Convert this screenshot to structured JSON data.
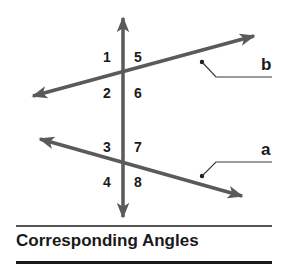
{
  "diagram": {
    "title": "Corresponding Angles",
    "colors": {
      "line": "#5a5a5a",
      "text": "#1a1a1a",
      "leader": "#3a3a3a"
    },
    "transversal": {
      "label": "",
      "x": 123,
      "y_top": 15,
      "y_bottom": 220
    },
    "lines": [
      {
        "id": "b",
        "label": "b",
        "from": [
          30,
          97
        ],
        "to": [
          257,
          35
        ],
        "intersection": [
          123,
          72
        ]
      },
      {
        "id": "a",
        "label": "a",
        "from": [
          37,
          138
        ],
        "to": [
          245,
          197
        ],
        "intersection": [
          123,
          162
        ]
      }
    ],
    "angles": [
      {
        "number": "1",
        "position": "upper-left",
        "line": "b"
      },
      {
        "number": "5",
        "position": "upper-right",
        "line": "b"
      },
      {
        "number": "2",
        "position": "lower-left",
        "line": "b"
      },
      {
        "number": "6",
        "position": "lower-right",
        "line": "b"
      },
      {
        "number": "3",
        "position": "upper-left",
        "line": "a"
      },
      {
        "number": "7",
        "position": "upper-right",
        "line": "a"
      },
      {
        "number": "4",
        "position": "lower-left",
        "line": "a"
      },
      {
        "number": "8",
        "position": "lower-right",
        "line": "a"
      }
    ],
    "labels": {
      "b": "b",
      "a": "a"
    }
  }
}
